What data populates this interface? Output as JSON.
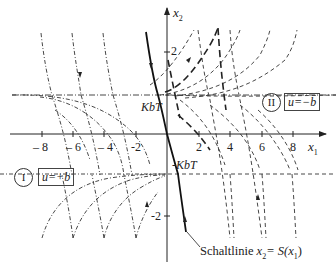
{
  "diagram": {
    "type": "phase-portrait",
    "axes": {
      "x_label": "x",
      "x_sub": "1",
      "y_label": "x",
      "y_sub": "2",
      "x_ticks": [
        "– 8",
        "– 6",
        "– 4",
        "-2",
        "2",
        "4",
        "6",
        "8"
      ],
      "y_ticks": [
        "2",
        "-2"
      ]
    },
    "levels": {
      "upper": "KbT",
      "lower": "-KbT"
    },
    "regions": [
      {
        "id": "I",
        "numeral": "I",
        "control": "u=+b"
      },
      {
        "id": "II",
        "numeral": "II",
        "control": "u=−b"
      }
    ],
    "switching_line": {
      "label": "Schaltlinie ",
      "eq_var": "x",
      "eq_sub": "2",
      "eq_rhs_pre": "= S(x",
      "eq_rhs_sub": "1",
      "eq_rhs_post": ")"
    },
    "colors": {
      "ink": "#222222",
      "background": "#ffffff"
    }
  }
}
